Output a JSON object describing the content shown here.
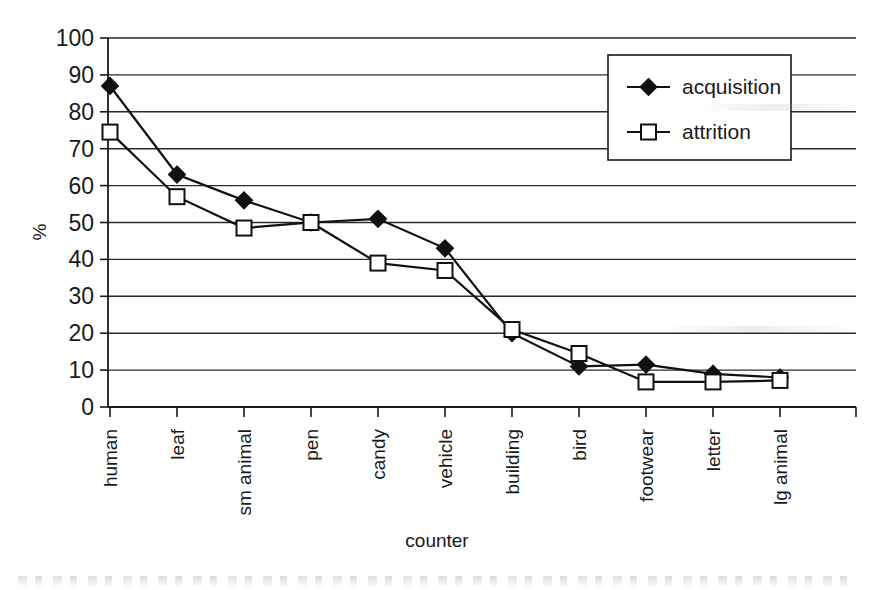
{
  "chart_data": {
    "type": "line",
    "title": "",
    "xlabel": "counter",
    "ylabel": "%",
    "ylim": [
      0,
      100
    ],
    "ytick_step": 10,
    "yticks": [
      0,
      10,
      20,
      30,
      40,
      50,
      60,
      70,
      80,
      90,
      100
    ],
    "ytick_labels": [
      "0",
      "10",
      "20",
      "30",
      "40",
      "50",
      "60",
      "70",
      "80",
      "90",
      "100"
    ],
    "grid": true,
    "grid_axis": "y",
    "legend_position": "top-right",
    "categories": [
      "human",
      "leaf",
      "sm animal",
      "pen",
      "candy",
      "vehicle",
      "building",
      "bird",
      "footwear",
      "letter",
      "lg animal"
    ],
    "series": [
      {
        "name": "acquisition",
        "marker": "filled-diamond",
        "values": [
          87,
          63,
          56,
          50,
          51,
          43,
          20,
          11,
          11.5,
          9,
          8
        ]
      },
      {
        "name": "attrition",
        "marker": "open-square",
        "values": [
          74.5,
          57,
          48.5,
          50,
          39,
          37,
          21,
          14.5,
          6.8,
          6.8,
          7.2
        ]
      }
    ]
  },
  "legend": {
    "entries": [
      {
        "label": "acquisition"
      },
      {
        "label": "attrition"
      }
    ]
  },
  "axes": {
    "y_title": "%",
    "x_title": "counter"
  },
  "colors": {
    "line": "#111111",
    "grid": "#2b2b2b",
    "axis": "#1a1a1a",
    "background": "#ffffff",
    "marker_fill_acquisition": "#111111",
    "marker_fill_attrition": "#ffffff"
  }
}
